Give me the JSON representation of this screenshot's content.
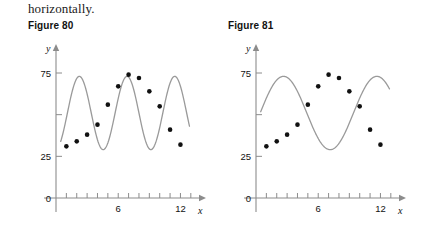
{
  "prose": {
    "text": "horizontally."
  },
  "figures": [
    {
      "id": "fig80",
      "caption": "Figure 80",
      "chart_data": {
        "type": "scatter",
        "title": "Figure 80",
        "xlabel": "x",
        "ylabel": "y",
        "xlim": [
          0,
          13.5
        ],
        "ylim": [
          0,
          90
        ],
        "xticks": [
          1,
          2,
          3,
          4,
          5,
          6,
          7,
          8,
          9,
          10,
          11,
          12,
          13
        ],
        "xtick_labels": [
          "",
          "",
          "",
          "",
          "",
          "6",
          "",
          "",
          "",
          "",
          "",
          "12",
          ""
        ],
        "yticks": [
          0,
          25,
          50,
          75
        ],
        "ytick_labels": [
          "0",
          "25",
          "50",
          "75"
        ],
        "grid": false,
        "legend": null,
        "series": [
          {
            "name": "data points",
            "type": "scatter",
            "marker": "filled-circle",
            "color": "#111111",
            "x": [
              1,
              2,
              3,
              4,
              5,
              6,
              7,
              8,
              9,
              10,
              11,
              12
            ],
            "y": [
              31,
              34,
              38,
              44,
              56,
              67,
              74,
              72,
              64,
              55,
              41,
              32
            ]
          },
          {
            "name": "fitted sinusoid",
            "type": "line",
            "color": "#9a9a9a",
            "equation": "y = 22*sin(2*pi*(x-1.1)/4.6) + 51",
            "amplitude": 22,
            "midline": 51,
            "period": 4.6,
            "phase_shift": 1.1,
            "cycles_visible": 2.6
          }
        ]
      }
    },
    {
      "id": "fig81",
      "caption": "Figure 81",
      "chart_data": {
        "type": "scatter",
        "title": "Figure 81",
        "xlabel": "x",
        "ylabel": "y",
        "xlim": [
          0,
          13.5
        ],
        "ylim": [
          0,
          90
        ],
        "xticks": [
          1,
          2,
          3,
          4,
          5,
          6,
          7,
          8,
          9,
          10,
          11,
          12,
          13
        ],
        "xtick_labels": [
          "",
          "",
          "",
          "",
          "",
          "6",
          "",
          "",
          "",
          "",
          "",
          "12",
          ""
        ],
        "yticks": [
          0,
          25,
          50,
          75
        ],
        "ytick_labels": [
          "0",
          "25",
          "50",
          "75"
        ],
        "grid": false,
        "legend": null,
        "series": [
          {
            "name": "data points",
            "type": "scatter",
            "marker": "filled-circle",
            "color": "#111111",
            "x": [
              1,
              2,
              3,
              4,
              5,
              6,
              7,
              8,
              9,
              10,
              11,
              12
            ],
            "y": [
              31,
              34,
              38,
              44,
              56,
              67,
              74,
              72,
              64,
              55,
              41,
              32
            ]
          },
          {
            "name": "fitted sinusoid",
            "type": "line",
            "color": "#9a9a9a",
            "equation": "y = 22*sin(2*pi*(x-0.4)/9.0) + 51",
            "amplitude": 22,
            "midline": 51,
            "period": 9.0,
            "phase_shift": 0.4,
            "cycles_visible": 1.3
          }
        ]
      }
    }
  ],
  "axis_icons": {
    "x_arrow": "arrow-right-icon",
    "y_arrow": "arrow-up-icon"
  }
}
